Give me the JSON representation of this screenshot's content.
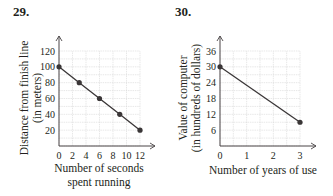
{
  "problems": [
    {
      "number": "29."
    },
    {
      "number": "30."
    }
  ],
  "chart_data": [
    {
      "type": "line",
      "title": "29.",
      "xlabel": "Number of seconds spent running",
      "xlabel_lines": [
        "Number of seconds",
        "spent running"
      ],
      "ylabel": "Distance from finish line (in meters)",
      "ylabel_lines": [
        "Distance from finish line",
        "(in meters)"
      ],
      "x": [
        0,
        3,
        6,
        9,
        12
      ],
      "values": [
        100,
        80,
        60,
        40,
        20
      ],
      "markers": true,
      "x_ticks": [
        "0",
        "2",
        "4",
        "6",
        "8",
        "10",
        "12"
      ],
      "y_ticks": [
        "20",
        "40",
        "60",
        "80",
        "100",
        "120"
      ],
      "xlim": [
        0,
        12
      ],
      "ylim": [
        0,
        120
      ],
      "grid": true
    },
    {
      "type": "line",
      "title": "30.",
      "xlabel": "Number of years of use",
      "xlabel_lines": [
        "Number of years of use"
      ],
      "ylabel": "Value of computer (in hundreds of dollars)",
      "ylabel_lines": [
        "Value of computer",
        "(in hundreds of dollars)"
      ],
      "x": [
        0,
        3
      ],
      "values": [
        30,
        9
      ],
      "markers": true,
      "x_ticks": [
        "0",
        "1",
        "2",
        "3"
      ],
      "y_ticks": [
        "6",
        "12",
        "18",
        "24",
        "30",
        "36"
      ],
      "xlim": [
        0,
        3
      ],
      "ylim": [
        0,
        36
      ],
      "grid": true
    }
  ],
  "style": {
    "line_color": "#3a3637",
    "grid_color": "#d8d8d8",
    "axis_color": "#4a4546"
  }
}
